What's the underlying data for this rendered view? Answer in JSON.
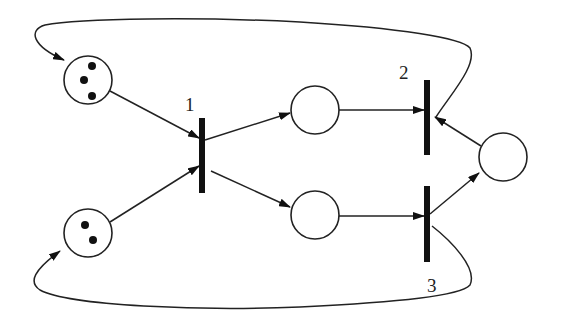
{
  "diagram": {
    "type": "petri-net",
    "colors": {
      "stroke": "#222222",
      "background": "#ffffff",
      "token": "#111111"
    },
    "places": [
      {
        "id": "p1",
        "cx": 88,
        "cy": 80,
        "r": 24,
        "tokens": 3
      },
      {
        "id": "p2",
        "cx": 88,
        "cy": 233,
        "r": 24,
        "tokens": 2
      },
      {
        "id": "p3",
        "cx": 315,
        "cy": 110,
        "r": 24,
        "tokens": 0
      },
      {
        "id": "p4",
        "cx": 315,
        "cy": 215,
        "r": 24,
        "tokens": 0
      },
      {
        "id": "p5",
        "cx": 503,
        "cy": 157,
        "r": 24,
        "tokens": 0
      }
    ],
    "transitions": [
      {
        "id": "t1",
        "label": "1",
        "x": 202,
        "y1": 118,
        "y2": 193
      },
      {
        "id": "t2",
        "label": "2",
        "x": 427,
        "y1": 80,
        "y2": 155
      },
      {
        "id": "t3",
        "label": "3",
        "x": 427,
        "y1": 186,
        "y2": 262
      }
    ],
    "arcs": [
      {
        "from": "p1",
        "to": "t1"
      },
      {
        "from": "p2",
        "to": "t1"
      },
      {
        "from": "t1",
        "to": "p3"
      },
      {
        "from": "t1",
        "to": "p4"
      },
      {
        "from": "p3",
        "to": "t2"
      },
      {
        "from": "p4",
        "to": "t3"
      },
      {
        "from": "p5",
        "to": "t2"
      },
      {
        "from": "t3",
        "to": "p5"
      },
      {
        "from": "t2",
        "to": "p1",
        "shape": "loop-over-top"
      },
      {
        "from": "t3",
        "to": "p2",
        "shape": "loop-under-bottom"
      }
    ]
  }
}
